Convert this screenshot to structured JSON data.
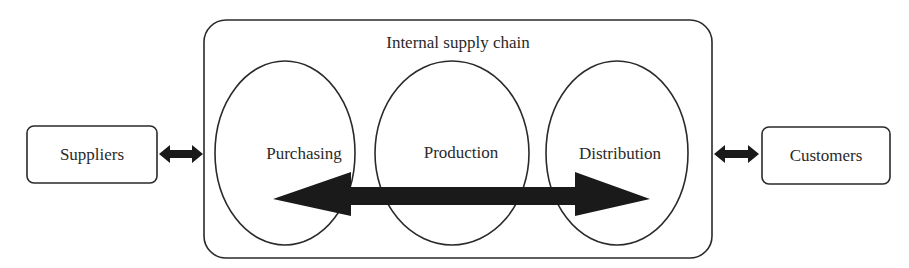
{
  "diagram": {
    "container": {
      "label": "Internal supply chain"
    },
    "external": {
      "left": {
        "label": "Suppliers"
      },
      "right": {
        "label": "Customers"
      }
    },
    "stages": [
      {
        "label": "Purchasing"
      },
      {
        "label": "Production"
      },
      {
        "label": "Distribution"
      }
    ],
    "flows": [
      {
        "from": "Suppliers",
        "to": "Internal supply chain",
        "direction": "bidirectional"
      },
      {
        "from": "Internal supply chain",
        "to": "Customers",
        "direction": "bidirectional"
      },
      {
        "from": "Purchasing",
        "to": "Distribution",
        "direction": "bidirectional",
        "style": "large-arrow"
      }
    ],
    "colors": {
      "stroke": "#2a2a2a",
      "arrow_fill": "#1a1a1a",
      "background": "#ffffff"
    }
  }
}
